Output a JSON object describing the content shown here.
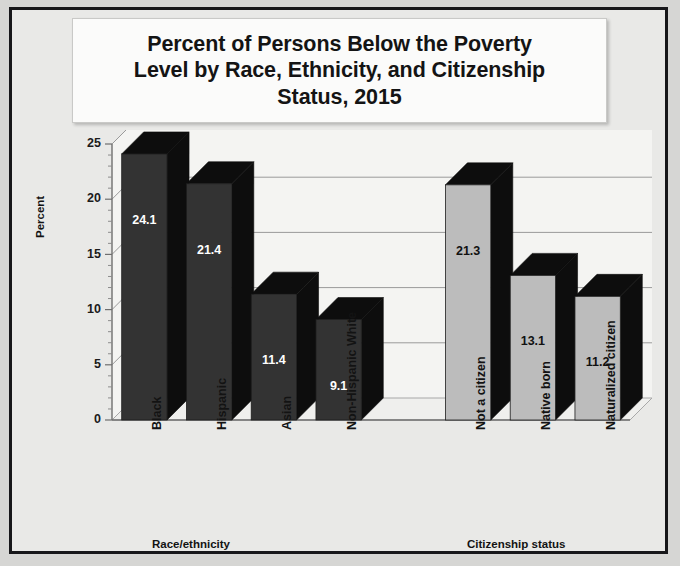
{
  "chart_data": {
    "type": "bar",
    "title": "Percent of Persons Below the Poverty Level by Race, Ethnicity, and Citizenship Status, 2015",
    "title_lines": [
      "Percent of Persons Below the Poverty",
      "Level by Race, Ethnicity, and Citizenship",
      "Status, 2015"
    ],
    "ylabel": "Percent",
    "xlabel": "",
    "ylim": [
      0,
      25
    ],
    "yticks": [
      0,
      5,
      10,
      15,
      20,
      25
    ],
    "ytick_labels": [
      "0",
      "5",
      "10",
      "15",
      "20",
      "25"
    ],
    "minor_tick_step": 1,
    "grid": true,
    "legend": "none",
    "three_d": true,
    "group_labels": [
      "Race/ethnicity",
      "Citizenship status"
    ],
    "categories": [
      "Black",
      "Hispanic",
      "Asian",
      "Non-Hispanic White",
      "Not a citizen",
      "Native born",
      "Naturalized citizen"
    ],
    "values": [
      24.1,
      21.4,
      11.4,
      9.1,
      21.3,
      13.1,
      11.2
    ],
    "value_labels": [
      "24.1",
      "21.4",
      "11.4",
      "9.1",
      "21.3",
      "13.1",
      "11.2"
    ],
    "bars": [
      {
        "category": "Black",
        "value": 24.1,
        "label": "24.1",
        "group": "Race/ethnicity",
        "slot": 0,
        "fill": "#333333",
        "label_color": "#ffffff"
      },
      {
        "category": "Hispanic",
        "value": 21.4,
        "label": "21.4",
        "group": "Race/ethnicity",
        "slot": 1,
        "fill": "#333333",
        "label_color": "#ffffff"
      },
      {
        "category": "Asian",
        "value": 11.4,
        "label": "11.4",
        "group": "Race/ethnicity",
        "slot": 2,
        "fill": "#333333",
        "label_color": "#ffffff"
      },
      {
        "category": "Non-Hispanic White",
        "value": 9.1,
        "label": "9.1",
        "group": "Race/ethnicity",
        "slot": 3,
        "fill": "#333333",
        "label_color": "#ffffff"
      },
      {
        "category": "Not a citizen",
        "value": 21.3,
        "label": "21.3",
        "group": "Citizenship status",
        "slot": 5,
        "fill": "#bcbcbc",
        "label_color": "#111111"
      },
      {
        "category": "Native born",
        "value": 13.1,
        "label": "13.1",
        "group": "Citizenship status",
        "slot": 6,
        "fill": "#bcbcbc",
        "label_color": "#111111"
      },
      {
        "category": "Naturalized citizen",
        "value": 11.2,
        "label": "11.2",
        "group": "Citizenship status",
        "slot": 7,
        "fill": "#bcbcbc",
        "label_color": "#111111"
      }
    ],
    "colors": {
      "race_bar": "#333333",
      "citizenship_bar": "#bcbcbc",
      "bar_3d_side": "#0d0d0d",
      "plot_background": "#f4f4f2",
      "gridline": "#9a9a9a",
      "frame_border": "#17171a",
      "page_background": "#e9e9e7"
    }
  }
}
